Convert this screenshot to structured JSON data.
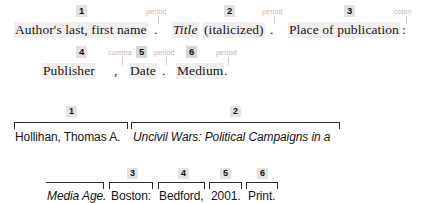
{
  "template": {
    "line1": {
      "slots": [
        {
          "number": "1",
          "text": "Author's last, first name",
          "italic": false
        },
        {
          "number": "2",
          "text": "Title",
          "italic": true,
          "suffix": " (italicized)"
        },
        {
          "number": "3",
          "text": "Place of publication",
          "italic": false
        }
      ],
      "separators": [
        {
          "label": "period",
          "glyph": "."
        },
        {
          "label": "period",
          "glyph": "."
        },
        {
          "label": "colon",
          "glyph": ":"
        }
      ]
    },
    "line2": {
      "slots": [
        {
          "number": "4",
          "text": "Publisher",
          "italic": false
        },
        {
          "number": "5",
          "text": "Date",
          "italic": false
        },
        {
          "number": "6",
          "text": "Medium",
          "italic": false
        }
      ],
      "separators": [
        {
          "label": "comma",
          "glyph": ","
        },
        {
          "label": "period",
          "glyph": "."
        },
        {
          "label": "period",
          "glyph": "."
        }
      ]
    }
  },
  "example": {
    "line1": {
      "parts": [
        {
          "number": "1",
          "text": "Hollihan, Thomas A.",
          "italic": false
        },
        {
          "number": "2",
          "text": "Uncivil Wars: Political Campaigns in a",
          "italic": true
        }
      ]
    },
    "line2": {
      "parts": [
        {
          "number": "",
          "text": "Media Age.",
          "italic": true
        },
        {
          "number": "3",
          "text": "Boston:",
          "italic": false
        },
        {
          "number": "4",
          "text": "Bedford,",
          "italic": false
        },
        {
          "number": "5",
          "text": "2001.",
          "italic": false
        },
        {
          "number": "6",
          "text": "Print.",
          "italic": false
        }
      ]
    }
  },
  "colors": {
    "phrase_highlight": "#f0efed",
    "number_chip": "#e2e1df",
    "punct_label": "#b8b7b5",
    "rule": "#2a2a2a",
    "text": "#171717"
  }
}
